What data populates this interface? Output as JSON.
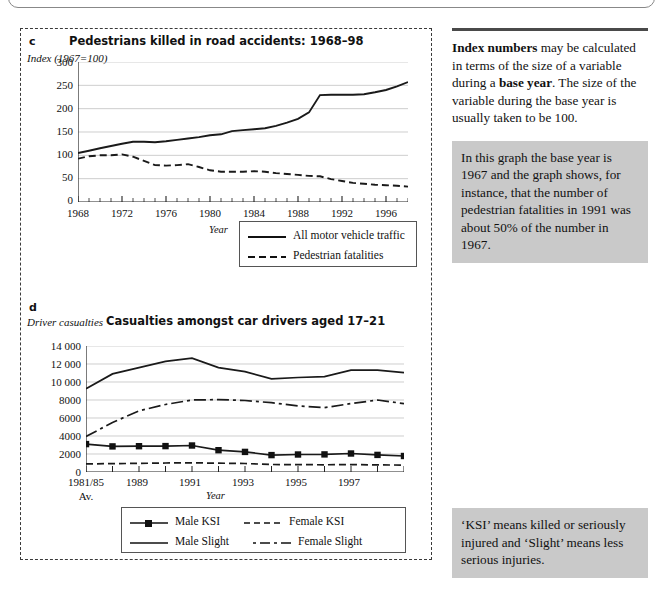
{
  "page": {
    "background": "#ffffff",
    "panel_border_color": "#3a3a3a"
  },
  "chart_c": {
    "letter": "c",
    "title": "Pedestrians killed in road accidents: 1968–98",
    "y_caption": "Index (1967=100)",
    "x_title": "Year",
    "y_ticks": [
      "0",
      "50",
      "100",
      "150",
      "200",
      "250",
      "300"
    ],
    "x_ticks": [
      "1968",
      "1972",
      "1976",
      "1980",
      "1984",
      "1988",
      "1992",
      "1996"
    ],
    "legend": [
      {
        "label": "All motor vehicle traffic",
        "style": "solid"
      },
      {
        "label": "Pedestrian fatalities",
        "style": "dashed"
      }
    ]
  },
  "chart_d": {
    "letter": "d",
    "title": "Casualties amongst car drivers aged 17–21",
    "y_caption": "Driver casualties",
    "x_title": "Year",
    "y_ticks": [
      "0",
      "2000",
      "4000",
      "6000",
      "8000",
      "10 000",
      "12 000",
      "14 000"
    ],
    "x_ticks": [
      "1981/85",
      "1989",
      "1991",
      "1993",
      "1995",
      "1997"
    ],
    "x_tick_sub": "Av.",
    "legend": [
      {
        "label": "Male KSI",
        "style": "solid-marker"
      },
      {
        "label": "Female KSI",
        "style": "dashed"
      },
      {
        "label": "Male Slight",
        "style": "solid"
      },
      {
        "label": "Female Slight",
        "style": "dashdot"
      }
    ]
  },
  "sidebar": {
    "note_html": "<b>Index numbers</b> may be calculated in terms of the size of a variable during a <b>base year</b>. The size of the variable during the base year is usually taken to be 100.",
    "box_1": "In this graph the base year is 1967 and the graph shows, for instance, that the number of pedestrian fatalities in 1991 was about 50% of the number in 1967.",
    "box_2": "‘KSI’ means killed or seriously injured and ‘Slight’ means less serious injuries."
  },
  "chart_data": [
    {
      "type": "line",
      "id": "chart_c",
      "title": "Pedestrians killed in road accidents: 1968–98",
      "xlabel": "Year",
      "ylabel": "Index (1967=100)",
      "xlim": [
        1968,
        1998
      ],
      "ylim": [
        0,
        300
      ],
      "grid": true,
      "legend_position": "bottom-right",
      "x": [
        1968,
        1969,
        1970,
        1971,
        1972,
        1973,
        1974,
        1975,
        1976,
        1977,
        1978,
        1979,
        1980,
        1981,
        1982,
        1983,
        1984,
        1985,
        1986,
        1987,
        1988,
        1989,
        1990,
        1991,
        1992,
        1993,
        1994,
        1995,
        1996,
        1997,
        1998
      ],
      "series": [
        {
          "name": "All motor vehicle traffic",
          "style": "solid",
          "values": [
            105,
            110,
            115,
            120,
            125,
            129,
            129,
            128,
            130,
            133,
            136,
            139,
            143,
            145,
            152,
            154,
            156,
            158,
            163,
            170,
            178,
            192,
            229,
            230,
            230,
            230,
            231,
            235,
            240,
            248,
            257
          ]
        },
        {
          "name": "Pedestrian fatalities",
          "style": "dashed",
          "values": [
            93,
            98,
            100,
            100,
            102,
            97,
            88,
            79,
            78,
            79,
            81,
            75,
            68,
            65,
            65,
            65,
            66,
            65,
            62,
            60,
            58,
            56,
            55,
            49,
            45,
            41,
            39,
            37,
            36,
            35,
            33
          ]
        }
      ]
    },
    {
      "type": "line",
      "id": "chart_d",
      "title": "Casualties amongst car drivers aged 17–21",
      "xlabel": "Year",
      "ylabel": "Driver casualties",
      "xlim": [
        "1981/85 Av.",
        1998
      ],
      "ylim": [
        0,
        14000
      ],
      "grid": true,
      "legend_position": "bottom",
      "categories": [
        "1981/85 Av.",
        "1987",
        "1988",
        "1989",
        "1990",
        "1991",
        "1992",
        "1993",
        "1994",
        "1995",
        "1996",
        "1997",
        "1998"
      ],
      "series": [
        {
          "name": "Male KSI",
          "style": "solid-marker",
          "values": [
            3100,
            2850,
            2870,
            2880,
            2950,
            2420,
            2230,
            1880,
            1950,
            1960,
            2060,
            1900,
            1780
          ]
        },
        {
          "name": "Male Slight",
          "style": "solid",
          "values": [
            9250,
            10900,
            11600,
            12300,
            12650,
            11600,
            11150,
            10350,
            10500,
            10600,
            11350,
            11350,
            11050
          ]
        },
        {
          "name": "Female KSI",
          "style": "dashed",
          "values": [
            900,
            930,
            960,
            1000,
            1020,
            980,
            950,
            830,
            820,
            800,
            820,
            790,
            770
          ]
        },
        {
          "name": "Female Slight",
          "style": "dashdot",
          "values": [
            3950,
            5500,
            6800,
            7500,
            8000,
            8050,
            7950,
            7700,
            7350,
            7150,
            7600,
            8000,
            7600
          ]
        }
      ]
    }
  ]
}
